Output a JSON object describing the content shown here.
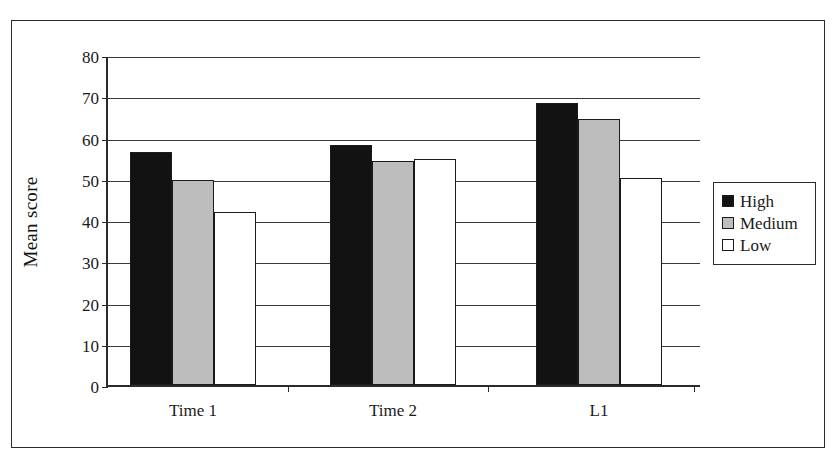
{
  "chart_data": {
    "type": "bar",
    "title": "",
    "xlabel": "",
    "ylabel": "Mean score",
    "categories": [
      "Time 1",
      "Time 2",
      "L1"
    ],
    "series": [
      {
        "name": "High",
        "color": "#121212",
        "values": [
          56.5,
          58.2,
          68.3
        ]
      },
      {
        "name": "Medium",
        "color": "#bdbdbd",
        "values": [
          49.8,
          54.2,
          64.4
        ]
      },
      {
        "name": "Low",
        "color": "#ffffff",
        "values": [
          42.0,
          54.8,
          50.2
        ]
      }
    ],
    "ylim": [
      0,
      80
    ],
    "ytick_values": [
      0,
      10,
      20,
      30,
      40,
      50,
      60,
      70,
      80
    ],
    "ytick_labels": [
      "0",
      "10",
      "20",
      "30",
      "40",
      "50",
      "60",
      "70",
      "80"
    ],
    "grid": true,
    "grid_axis": "y",
    "legend_position": "right",
    "legend_entries": [
      "High",
      "Medium",
      "Low"
    ],
    "axis_color": "#2b2b2b",
    "background": "#ffffff"
  }
}
